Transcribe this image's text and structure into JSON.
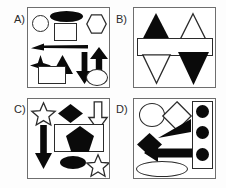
{
  "figure": {
    "title": "",
    "background_color": "#fdfdfd",
    "panel_border_color": "#6e6e6e",
    "fill_black": "#0a0a0a",
    "fill_white": "#ffffff",
    "outline_color": "#2b2b2b",
    "panel_count": 4
  },
  "panels": [
    {
      "id": "A",
      "label": "A)",
      "shapes": [
        {
          "name": "circle-outline",
          "shape": "circle",
          "fill": "white",
          "row": 1
        },
        {
          "name": "ellipse-filled",
          "shape": "ellipse",
          "fill": "black",
          "row": 1
        },
        {
          "name": "square-outline",
          "shape": "square",
          "fill": "white",
          "row": 1
        },
        {
          "name": "hexagon-outline",
          "shape": "hexagon",
          "fill": "white",
          "row": 1
        },
        {
          "name": "arrow-left-filled",
          "shape": "arrow-left",
          "fill": "black",
          "row": 2
        },
        {
          "name": "four-point-star-filled",
          "shape": "star4",
          "fill": "black",
          "row": 3
        },
        {
          "name": "triangle-up-filled",
          "shape": "triangle-up",
          "fill": "black",
          "row": 3
        },
        {
          "name": "arrow-down-filled",
          "shape": "arrow-down",
          "fill": "black",
          "row": 3
        },
        {
          "name": "arrow-up-filled",
          "shape": "arrow-up",
          "fill": "black",
          "row": 3
        },
        {
          "name": "rectangle-outline",
          "shape": "rectangle",
          "fill": "white",
          "row": 4
        },
        {
          "name": "ellipse-outline",
          "shape": "ellipse",
          "fill": "white",
          "row": 4
        }
      ],
      "shape_count": 11
    },
    {
      "id": "B",
      "label": "B)",
      "shapes": [
        {
          "name": "triangle-up-filled",
          "shape": "triangle-up",
          "fill": "black",
          "row": 1
        },
        {
          "name": "triangle-up-outline",
          "shape": "triangle-up",
          "fill": "white",
          "row": 1
        },
        {
          "name": "rectangle-wide-outline",
          "shape": "rectangle",
          "fill": "white",
          "row": 2
        },
        {
          "name": "triangle-down-outline",
          "shape": "triangle-down",
          "fill": "white",
          "row": 3
        },
        {
          "name": "triangle-down-filled",
          "shape": "triangle-down",
          "fill": "black",
          "row": 3
        }
      ],
      "shape_count": 5
    },
    {
      "id": "C",
      "label": "C)",
      "shapes": [
        {
          "name": "five-point-star-outline",
          "shape": "star5",
          "fill": "white",
          "row": 1
        },
        {
          "name": "diamond-filled",
          "shape": "diamond",
          "fill": "black",
          "row": 1
        },
        {
          "name": "arrow-down-outline",
          "shape": "arrow-down",
          "fill": "white",
          "row": 1
        },
        {
          "name": "arrow-down-filled",
          "shape": "arrow-down",
          "fill": "black",
          "row": 2
        },
        {
          "name": "rectangle-outline",
          "shape": "rectangle",
          "fill": "white",
          "row": 2
        },
        {
          "name": "pentagon-filled",
          "shape": "pentagon",
          "fill": "black",
          "row": 2
        },
        {
          "name": "ellipse-filled",
          "shape": "ellipse",
          "fill": "black",
          "row": 3
        },
        {
          "name": "five-point-star-outline-2",
          "shape": "star5",
          "fill": "white",
          "row": 3
        }
      ],
      "shape_count": 8
    },
    {
      "id": "D",
      "label": "D)",
      "shapes": [
        {
          "name": "circle-outline",
          "shape": "circle",
          "fill": "white",
          "row": 1
        },
        {
          "name": "diamond-outline",
          "shape": "diamond",
          "fill": "white",
          "row": 1
        },
        {
          "name": "rectangle-tall-outline",
          "shape": "rectangle",
          "fill": "white",
          "row": 1
        },
        {
          "name": "circle-filled-1",
          "shape": "circle",
          "fill": "black",
          "row": 1
        },
        {
          "name": "triangle-wedge-filled",
          "shape": "triangle-right",
          "fill": "black",
          "row": 2
        },
        {
          "name": "circle-filled-2",
          "shape": "circle",
          "fill": "black",
          "row": 2
        },
        {
          "name": "diamond-filled",
          "shape": "diamond",
          "fill": "black",
          "row": 2
        },
        {
          "name": "arrow-left-filled",
          "shape": "arrow-left",
          "fill": "black",
          "row": 3
        },
        {
          "name": "circle-filled-3",
          "shape": "circle",
          "fill": "black",
          "row": 3
        },
        {
          "name": "ellipse-outline",
          "shape": "ellipse",
          "fill": "white",
          "row": 4
        }
      ],
      "shape_count": 10
    }
  ]
}
